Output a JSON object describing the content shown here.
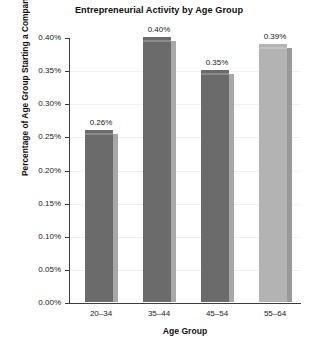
{
  "chart_data": {
    "type": "bar",
    "title": "Entrepreneurial Activity by Age Group",
    "xlabel": "Age Group",
    "ylabel": "Percentage of Age Group Starting a Company",
    "categories": [
      "20–34",
      "35–44",
      "45–54",
      "55–64"
    ],
    "values": [
      0.26,
      0.4,
      0.35,
      0.39
    ],
    "value_labels": [
      "0.26%",
      "0.40%",
      "0.35%",
      "0.39%"
    ],
    "ylim": [
      0,
      0.4
    ],
    "ytick_values": [
      0.0,
      0.05,
      0.1,
      0.15,
      0.2,
      0.25,
      0.3,
      0.35,
      0.4
    ],
    "ytick_labels": [
      "0.00%",
      "0.05%",
      "0.10%",
      "0.15%",
      "0.20%",
      "0.25%",
      "0.30%",
      "0.35%",
      "0.40%"
    ],
    "grid": true,
    "legend": false,
    "bar_colors": [
      "#6b6b6b",
      "#6b6b6b",
      "#6b6b6b",
      "#b3b3b3"
    ],
    "bar_side_colors": [
      "#a8a8a8",
      "#a8a8a8",
      "#a8a8a8",
      "#9a9a9a"
    ],
    "background_color": "#ffffff",
    "axis_color": "#3d3d3d",
    "gridline_color": "#efefef"
  }
}
